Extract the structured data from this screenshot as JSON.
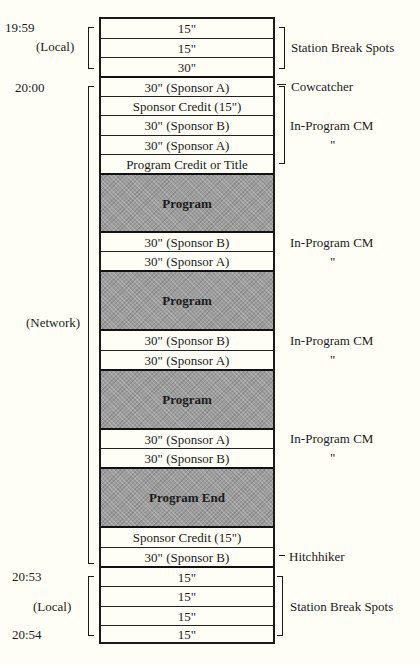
{
  "diagram": {
    "type": "broadcast-schedule-timeline",
    "time_labels": {
      "t1959": "19:59",
      "t2000": "20:00",
      "t2053": "20:53",
      "t2054": "20:54"
    },
    "segment_labels": {
      "local_top": "(Local)",
      "network": "(Network)",
      "local_bottom": "(Local)"
    },
    "rows": [
      {
        "label": "15\"",
        "kind": "spot"
      },
      {
        "label": "15\"",
        "kind": "spot"
      },
      {
        "label": "30\"",
        "kind": "spot"
      },
      {
        "label": "30\"  (Sponsor A)",
        "kind": "spot"
      },
      {
        "label": "Sponsor Credit (15\")",
        "kind": "spot"
      },
      {
        "label": "30\"  (Sponsor B)",
        "kind": "spot"
      },
      {
        "label": "30\"  (Sponsor A)",
        "kind": "spot"
      },
      {
        "label": "Program Credit or Title",
        "kind": "spot"
      },
      {
        "label": "Program",
        "kind": "program"
      },
      {
        "label": "30\"  (Sponsor B)",
        "kind": "spot"
      },
      {
        "label": "30\"  (Sponsor A)",
        "kind": "spot"
      },
      {
        "label": "Program",
        "kind": "program"
      },
      {
        "label": "30\"  (Sponsor B)",
        "kind": "spot"
      },
      {
        "label": "30\"  (Sponsor A)",
        "kind": "spot"
      },
      {
        "label": "Program",
        "kind": "program"
      },
      {
        "label": "30\"  (Sponsor A)",
        "kind": "spot"
      },
      {
        "label": "30\"  (Sponsor B)",
        "kind": "spot"
      },
      {
        "label": "Program End",
        "kind": "program"
      },
      {
        "label": "Sponsor Credit (15\")",
        "kind": "spot"
      },
      {
        "label": "30\"  (Sponsor B)",
        "kind": "spot"
      },
      {
        "label": "15\"",
        "kind": "spot"
      },
      {
        "label": "15\"",
        "kind": "spot"
      },
      {
        "label": "15\"",
        "kind": "spot"
      },
      {
        "label": "15\"",
        "kind": "spot"
      }
    ],
    "annotations": {
      "station_break_top": "Station Break Spots",
      "cowcatcher": "Cowcatcher",
      "in_program_1": "In-Program CM",
      "ditto_1": "\"",
      "in_program_2": "In-Program CM",
      "ditto_2": "\"",
      "in_program_3": "In-Program CM",
      "ditto_3": "\"",
      "in_program_4": "In-Program CM",
      "ditto_4": "\"",
      "hitchhiker": "Hitchhiker",
      "station_break_bottom": "Station Break Spots"
    },
    "colors": {
      "background": "#fffef6",
      "program_fill": "#9d9d9d",
      "line": "#1a1a1a"
    }
  }
}
